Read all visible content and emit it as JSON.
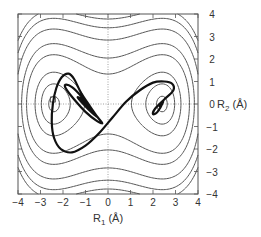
{
  "chart_data": {
    "type": "line",
    "subtype": "contour_with_trajectory",
    "title": "",
    "xlabel": "R1 (Å)",
    "ylabel": "R2 (Å)",
    "xlabel_parts": {
      "main": "R",
      "sub": "1",
      "unit": " (Å)"
    },
    "ylabel_parts": {
      "main": "R",
      "sub": "2",
      "unit": " (Å)"
    },
    "xlim": [
      -4,
      4
    ],
    "ylim": [
      -4,
      4
    ],
    "xticks": [
      -4,
      -3,
      -2,
      -1,
      0,
      1,
      2,
      3,
      4
    ],
    "yticks": [
      -4,
      -3,
      -2,
      -1,
      0,
      1,
      2,
      3,
      4
    ],
    "xtick_labels": [
      "−4",
      "−3",
      "−2",
      "−1",
      "0",
      "1",
      "2",
      "3",
      "4"
    ],
    "ytick_labels": [
      "−4",
      "−3",
      "−2",
      "−1",
      "0",
      "1",
      "2",
      "3",
      "4"
    ],
    "y_axis_position": "right",
    "grid": false,
    "zero_lines": "dotted",
    "legend": null,
    "potential": {
      "description": "Symmetric double-well potential surface, minima near R1 = ±2.4 Å, R2 = 0",
      "form": "V = a*(R1^2 - b)^2 + R2^2",
      "a": 0.09,
      "b": 5.8,
      "contour_levels": [
        0.12,
        0.8,
        2.0,
        4.8,
        7.2,
        11.1,
        14.5,
        17.3
      ]
    },
    "trajectory": {
      "name": "trajectory",
      "style": "thick black line",
      "points": [
        [
          2.3,
          -0.1
        ],
        [
          2.45,
          0.1
        ],
        [
          2.2,
          -0.35
        ],
        [
          2.0,
          -0.45
        ],
        [
          2.1,
          -0.2
        ],
        [
          2.5,
          0.2
        ],
        [
          2.9,
          0.6
        ],
        [
          2.85,
          0.9
        ],
        [
          2.5,
          1.0
        ],
        [
          2.0,
          0.95
        ],
        [
          1.4,
          0.6
        ],
        [
          0.8,
          0.1
        ],
        [
          0.2,
          -0.6
        ],
        [
          -0.4,
          -1.3
        ],
        [
          -1.0,
          -1.85
        ],
        [
          -1.6,
          -2.15
        ],
        [
          -2.1,
          -2.0
        ],
        [
          -2.4,
          -1.5
        ],
        [
          -2.5,
          -0.8
        ],
        [
          -2.45,
          0.0
        ],
        [
          -2.3,
          0.7
        ],
        [
          -2.05,
          1.2
        ],
        [
          -1.75,
          1.35
        ],
        [
          -1.5,
          1.1
        ],
        [
          -1.2,
          0.5
        ],
        [
          -0.8,
          -0.1
        ],
        [
          -0.45,
          -0.6
        ],
        [
          -0.25,
          -0.85
        ],
        [
          -0.5,
          -0.75
        ],
        [
          -1.0,
          -0.35
        ],
        [
          -1.5,
          0.2
        ],
        [
          -1.85,
          0.65
        ],
        [
          -1.9,
          0.85
        ],
        [
          -1.6,
          0.75
        ],
        [
          -1.2,
          0.35
        ],
        [
          -0.8,
          -0.2
        ],
        [
          -0.5,
          -0.55
        ],
        [
          -0.7,
          -0.4
        ],
        [
          -1.1,
          0.0
        ],
        [
          -1.35,
          0.3
        ],
        [
          -1.1,
          0.15
        ],
        [
          -0.8,
          -0.25
        ],
        [
          -0.6,
          -0.45
        ],
        [
          -0.85,
          -0.15
        ],
        [
          -1.2,
          0.25
        ],
        [
          -1.0,
          0.05
        ],
        [
          -0.7,
          -0.35
        ],
        [
          -0.9,
          -0.05
        ],
        [
          -1.15,
          0.2
        ],
        [
          -0.95,
          -0.1
        ]
      ]
    },
    "markers": [
      {
        "name": "left-minimum-label-box",
        "x": -2.45,
        "y": 0.2
      }
    ]
  }
}
